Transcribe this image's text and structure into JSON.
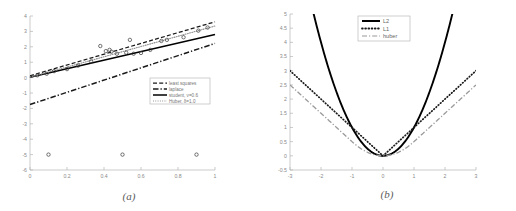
{
  "figure": {
    "subfigures": [
      {
        "caption": "(a)",
        "chart_index": 0
      },
      {
        "caption": "(b)",
        "chart_index": 1
      }
    ]
  },
  "chart_data": [
    {
      "type": "scatter",
      "title": "",
      "xlabel": "",
      "ylabel": "",
      "xlim": [
        0,
        1
      ],
      "ylim": [
        -6,
        4
      ],
      "xticks": [
        "0",
        "0.2",
        "0.4",
        "0.6",
        "0.8",
        "1"
      ],
      "xtick_values": [
        0,
        0.2,
        0.4,
        0.6,
        0.8,
        1
      ],
      "yticks": [
        "4",
        "3",
        "2",
        "1",
        "0",
        "-1",
        "-2",
        "-3",
        "-4",
        "-5",
        "-6"
      ],
      "ytick_values": [
        4,
        3,
        2,
        1,
        0,
        -1,
        -2,
        -3,
        -4,
        -5,
        -6
      ],
      "grid": false,
      "legend_position": "lower-right",
      "points": [
        {
          "x": 0.04,
          "y": 0.15
        },
        {
          "x": 0.09,
          "y": 0.25
        },
        {
          "x": 0.13,
          "y": 0.42
        },
        {
          "x": 0.2,
          "y": 0.55
        },
        {
          "x": 0.26,
          "y": 0.78
        },
        {
          "x": 0.33,
          "y": 1.05
        },
        {
          "x": 0.38,
          "y": 2.05
        },
        {
          "x": 0.41,
          "y": 1.72
        },
        {
          "x": 0.43,
          "y": 1.8
        },
        {
          "x": 0.44,
          "y": 1.68
        },
        {
          "x": 0.47,
          "y": 1.55
        },
        {
          "x": 0.52,
          "y": 1.62
        },
        {
          "x": 0.54,
          "y": 2.45
        },
        {
          "x": 0.56,
          "y": 1.55
        },
        {
          "x": 0.6,
          "y": 1.6
        },
        {
          "x": 0.65,
          "y": 1.8
        },
        {
          "x": 0.71,
          "y": 2.38
        },
        {
          "x": 0.74,
          "y": 2.45
        },
        {
          "x": 0.83,
          "y": 2.62
        },
        {
          "x": 0.91,
          "y": 3.05
        },
        {
          "x": 0.96,
          "y": 3.25
        },
        {
          "x": 0.1,
          "y": -5.0
        },
        {
          "x": 0.5,
          "y": -5.0
        },
        {
          "x": 0.9,
          "y": -5.0
        }
      ],
      "series": [
        {
          "name": "least squares",
          "style": "dashed",
          "color": "#1a1a1a",
          "line": {
            "x0": 0,
            "y0": 0.12,
            "x1": 1,
            "y1": 3.62
          }
        },
        {
          "name": "laplace",
          "style": "dashdot-thick",
          "color": "#1a1a1a",
          "line": {
            "x0": 0,
            "y0": -1.75,
            "x1": 1,
            "y1": 2.22
          }
        },
        {
          "name": "student, ν=0.6",
          "style": "solid",
          "color": "#000000",
          "line": {
            "x0": 0,
            "y0": 0.02,
            "x1": 1,
            "y1": 2.8
          }
        },
        {
          "name": "Huber, δ=1.0",
          "style": "dotted",
          "color": "#8c8c8c",
          "line": {
            "x0": 0,
            "y0": 0.02,
            "x1": 1,
            "y1": 3.35
          }
        }
      ]
    },
    {
      "type": "line",
      "title": "",
      "xlabel": "",
      "ylabel": "",
      "xlim": [
        -3,
        3
      ],
      "ylim": [
        -0.5,
        5
      ],
      "xticks": [
        "-3",
        "-2",
        "-1",
        "0",
        "1",
        "2",
        "3"
      ],
      "xtick_values": [
        -3,
        -2,
        -1,
        0,
        1,
        2,
        3
      ],
      "yticks": [
        "5",
        "4.5",
        "4",
        "3.5",
        "3",
        "2.5",
        "2",
        "1.5",
        "1",
        "0.5",
        "0",
        "-0.5"
      ],
      "ytick_values": [
        5,
        4.5,
        4,
        3.5,
        3,
        2.5,
        2,
        1.5,
        1,
        0.5,
        0,
        -0.5
      ],
      "grid": false,
      "legend_position": "upper-center",
      "series": [
        {
          "name": "L2",
          "style": "solid",
          "color": "#000000",
          "formula": "x^2"
        },
        {
          "name": "L1",
          "style": "dotted",
          "color": "#1a1a1a",
          "formula": "abs(x)"
        },
        {
          "name": "huber",
          "style": "dashdot",
          "color": "#9a9a9a",
          "formula": "huber(x, delta=1)"
        }
      ]
    }
  ]
}
